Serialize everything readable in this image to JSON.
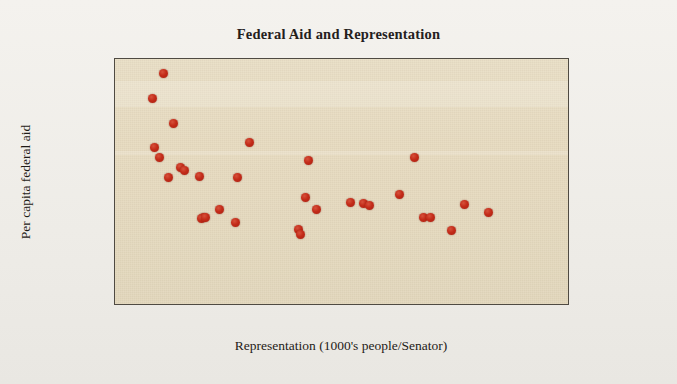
{
  "chart_data": {
    "type": "scatter",
    "title": "Federal Aid and Representation",
    "xlabel": "Representation (1000's people/Senator)",
    "ylabel": "Per capita federal aid",
    "xlim": [
      0,
      3500
    ],
    "ylim": [
      0,
      5000
    ],
    "xticks": [
      0,
      500,
      1000,
      1500,
      2000,
      2500,
      3000,
      3500
    ],
    "yticks": [
      0,
      500,
      1000,
      1500,
      2000,
      2500,
      3000,
      3500,
      4000,
      4500,
      5000
    ],
    "grid": false,
    "legend": null,
    "marker_color": "#c32b19",
    "plot_background": "#e6dabe",
    "series": [
      {
        "name": "States",
        "points": [
          [
            379,
            4700
          ],
          [
            291,
            4200
          ],
          [
            456,
            3700
          ],
          [
            308,
            3200
          ],
          [
            346,
            3000
          ],
          [
            417,
            2600
          ],
          [
            507,
            2800
          ],
          [
            540,
            2750
          ],
          [
            657,
            2630
          ],
          [
            1041,
            3300
          ],
          [
            943,
            2600
          ],
          [
            683,
            1800
          ],
          [
            668,
            1780
          ],
          [
            699,
            1800
          ],
          [
            805,
            1950
          ],
          [
            933,
            1700
          ],
          [
            1495,
            2950
          ],
          [
            1471,
            2200
          ],
          [
            1550,
            1950
          ],
          [
            1412,
            1550
          ],
          [
            1427,
            1450
          ],
          [
            1815,
            2100
          ],
          [
            1912,
            2080
          ],
          [
            1962,
            2030
          ],
          [
            2194,
            2250
          ],
          [
            2304,
            3000
          ],
          [
            2377,
            1800
          ],
          [
            2432,
            1790
          ],
          [
            2594,
            1520
          ],
          [
            2696,
            2050
          ],
          [
            2877,
            1900
          ]
        ]
      }
    ]
  },
  "axis": {
    "tick_labels_x": [
      "0",
      "500",
      "1000",
      "1500",
      "2000",
      "2500",
      "3000",
      "3500"
    ],
    "tick_labels_y": [
      "0",
      "500",
      "1000",
      "1500",
      "2000",
      "2500",
      "3000",
      "3500",
      "4000",
      "4500",
      "5000"
    ]
  }
}
